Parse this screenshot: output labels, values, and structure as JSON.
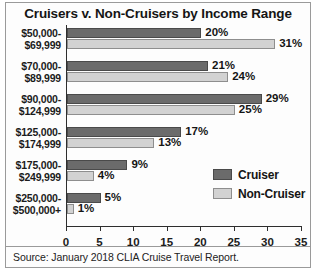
{
  "chart_data": {
    "type": "bar",
    "orientation": "horizontal",
    "title": "Cruisers v. Non-Cruisers by Income Range",
    "xlabel": "",
    "ylabel": "",
    "xlim": [
      0,
      35
    ],
    "xticks": [
      0,
      5,
      10,
      15,
      20,
      25,
      30,
      35
    ],
    "grid": false,
    "legend_position": "middle-right",
    "categories": [
      "$50,000-\n$69,999",
      "$70,000-\n$89,999",
      "$90,000-\n$124,999",
      "$125,000-\n$174,999",
      "$175,000-\n$249,999",
      "$250,000-\n$500,000+"
    ],
    "series": [
      {
        "name": "Cruiser",
        "color": "#6b6b6b",
        "values": [
          20,
          21,
          29,
          17,
          9,
          5
        ],
        "labels": [
          "20%",
          "21%",
          "29%",
          "17%",
          "9%",
          "5%"
        ]
      },
      {
        "name": "Non-Cruiser",
        "color": "#d2d2d2",
        "values": [
          31,
          24,
          25,
          13,
          4,
          1
        ],
        "labels": [
          "31%",
          "24%",
          "25%",
          "13%",
          "4%",
          "1%"
        ]
      }
    ]
  },
  "categories_display": [
    {
      "line1": "$50,000-",
      "line2": "$69,999"
    },
    {
      "line1": "$70,000-",
      "line2": "$89,999"
    },
    {
      "line1": "$90,000-",
      "line2": "$124,999"
    },
    {
      "line1": "$125,000-",
      "line2": "$174,999"
    },
    {
      "line1": "$175,000-",
      "line2": "$249,999"
    },
    {
      "line1": "$250,000-",
      "line2": "$500,000+"
    }
  ],
  "axis": {
    "tick_labels": [
      "0",
      "5",
      "10",
      "15",
      "20",
      "25",
      "30",
      "35"
    ]
  },
  "legend": {
    "items": [
      {
        "label": "Cruiser"
      },
      {
        "label": "Non-Cruiser"
      }
    ]
  },
  "source": {
    "text": "Source: January 2018 CLIA Cruise Travel Report."
  }
}
